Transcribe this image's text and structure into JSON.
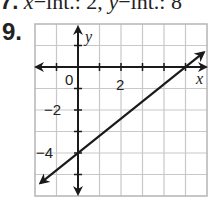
{
  "header": {
    "prev_problem_number": "7.",
    "prev_answer_parts": [
      "x",
      "-int.: 2, ",
      "y",
      "-int.: 8"
    ]
  },
  "problem": {
    "number": "9."
  },
  "chart_data": {
    "type": "line",
    "title": "",
    "xlabel": "x",
    "ylabel": "y",
    "xlim": [
      -2,
      6
    ],
    "ylim": [
      -6,
      2
    ],
    "grid": true,
    "x_tick_labels": [
      "0",
      "2"
    ],
    "y_tick_labels": [
      "-2",
      "-4"
    ],
    "series": [
      {
        "name": "line",
        "points": [
          [
            -2,
            -5.6
          ],
          [
            0,
            -4
          ],
          [
            5,
            0
          ],
          [
            6,
            0.8
          ]
        ],
        "slope": 0.8,
        "y_intercept": -4,
        "x_intercept": 5,
        "arrows_both_ends": true
      }
    ],
    "colors": {
      "line": "#1a1a1a",
      "grid": "#c8c8c8",
      "axis": "#1a1a1a"
    }
  }
}
